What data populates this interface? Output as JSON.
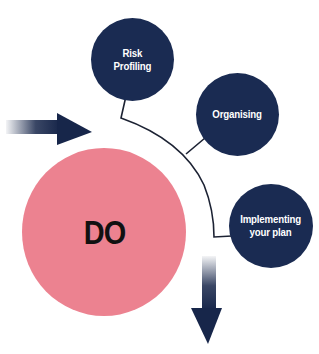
{
  "diagram": {
    "center": {
      "label": "DO",
      "color": "#ec8290"
    },
    "nodes": [
      {
        "id": "risk-profiling",
        "label": "Risk\nProfiling"
      },
      {
        "id": "organising",
        "label": "Organising"
      },
      {
        "id": "implementing",
        "label": "Implementing\nyour plan"
      }
    ],
    "colors": {
      "node_fill": "#1a2b52",
      "connector": "#1c2233",
      "arrow": "#17264a",
      "background": "#ffffff"
    },
    "arrows": [
      {
        "id": "incoming-arrow",
        "direction": "right"
      },
      {
        "id": "outgoing-arrow",
        "direction": "down"
      }
    ]
  }
}
